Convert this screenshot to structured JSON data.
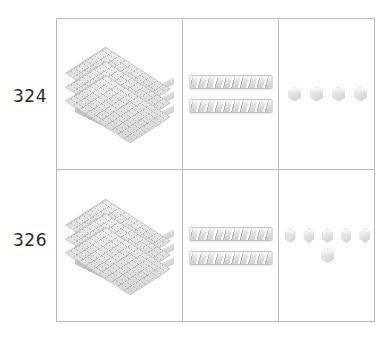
{
  "rows": [
    {
      "label": "324",
      "hundreds": {
        "count": 3,
        "block_name": "flat"
      },
      "tens": {
        "count": 2,
        "block_name": "rod"
      },
      "ones": {
        "count": 4,
        "block_name": "unit-cube",
        "layout": [
          4
        ]
      }
    },
    {
      "label": "326",
      "hundreds": {
        "count": 3,
        "block_name": "flat"
      },
      "tens": {
        "count": 2,
        "block_name": "rod"
      },
      "ones": {
        "count": 6,
        "block_name": "unit-cube",
        "layout": [
          5,
          1
        ]
      }
    }
  ],
  "colors": {
    "block_light": "#efefef",
    "block_mid": "#e2e2e3",
    "block_dark": "#cdcdcf",
    "block_edge": "#c0c0c2",
    "table_border": "#b9b9bb",
    "label_text": "#2b2b2b",
    "background": "#ffffff"
  }
}
